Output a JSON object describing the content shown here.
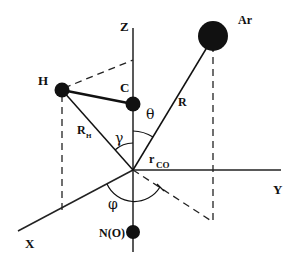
{
  "diagram": {
    "axes": {
      "x": "X",
      "y": "Y",
      "z": "Z"
    },
    "atoms": {
      "h": "H",
      "c": "C",
      "ar": "Ar",
      "n": "N(O)"
    },
    "distances": {
      "r": "R",
      "rh": "R",
      "rh_sub": "H",
      "rco": "r",
      "rco_sub": "CO"
    },
    "angles": {
      "theta": "θ",
      "gamma": "γ",
      "phi": "φ"
    }
  }
}
